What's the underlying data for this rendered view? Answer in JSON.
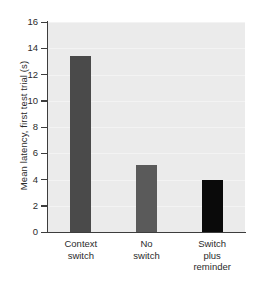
{
  "chart_data": {
    "type": "bar",
    "title": "",
    "subtitle": "",
    "xlabel": "",
    "ylabel": "Mean latency, first test trial (s)",
    "categories": [
      "Context switch",
      "No switch",
      "Switch plus reminder"
    ],
    "category_lines": [
      [
        "Context",
        "switch"
      ],
      [
        "No",
        "switch"
      ],
      [
        "Switch",
        "plus",
        "reminder"
      ]
    ],
    "values": [
      13.4,
      5.1,
      4.0
    ],
    "bar_colors": [
      "#4a4a4a",
      "#5a5a5a",
      "#0a0a0a"
    ],
    "ylim": [
      0,
      16
    ],
    "yticks": [
      0,
      2,
      4,
      6,
      8,
      10,
      12,
      14,
      16
    ],
    "ytick_labels": [
      "0",
      "2",
      "4",
      "6",
      "8",
      "10",
      "12",
      "14",
      "16"
    ],
    "xticks": [],
    "grid": true,
    "grid_axis": "y",
    "legend": false,
    "legend_position": "none",
    "annotations": [],
    "plot_background": "#ebebeb",
    "axis_color": "#3d3d3d",
    "figure_background": "#ffffff"
  }
}
